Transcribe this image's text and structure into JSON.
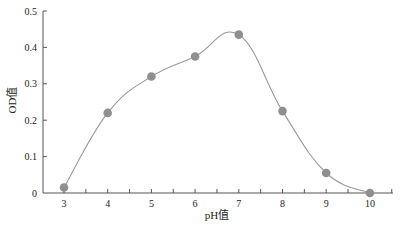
{
  "chart_data": {
    "type": "line",
    "title": "",
    "xlabel": "pH值",
    "ylabel": "OD值",
    "x": [
      3,
      4,
      5,
      6,
      7,
      8,
      9,
      10
    ],
    "series": [
      {
        "name": "OD值",
        "values": [
          0.015,
          0.22,
          0.32,
          0.375,
          0.435,
          0.225,
          0.055,
          0.0
        ],
        "color": "#9a9a9a",
        "marker": "circle",
        "smooth": true
      }
    ],
    "xlim": [
      2.5,
      10.5
    ],
    "ylim": [
      0,
      0.5
    ],
    "xticks": [
      "3",
      "4",
      "5",
      "6",
      "7",
      "8",
      "9",
      "10"
    ],
    "yticks": [
      "0",
      "0.1",
      "0.2",
      "0.3",
      "0.4",
      "0.5"
    ],
    "grid": false,
    "legend": "none"
  },
  "colors": {
    "axis": "#555555",
    "line": "#9a9a9a",
    "marker": "#8f8f8f"
  }
}
